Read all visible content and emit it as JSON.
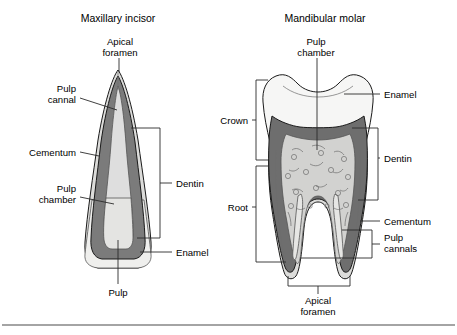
{
  "figure": {
    "background_color": "#ffffff",
    "bottom_rule_color": "#4a4a4a"
  },
  "palette": {
    "enamel": "#f2f2f0",
    "enamel_outer": "#e3e3e1",
    "cementum": "#dcdcda",
    "dentin": "#7b7b7b",
    "dentin_dark": "#6e6e6e",
    "pulp": "#d8d8d6",
    "pulp_light": "#e8e8e6",
    "outline": "#1a1a1a",
    "leader": "#2b2b2b",
    "text": "#000000"
  },
  "panels": [
    {
      "id": "maxillary-incisor",
      "title": "Maxillary incisor",
      "labels": [
        {
          "id": "apical-foramen",
          "lines": [
            "Apical",
            "foramen"
          ],
          "anchor": "middle",
          "x": 120,
          "y": 52
        },
        {
          "id": "pulp-cannal",
          "lines": [
            "Pulp",
            "cannal"
          ],
          "anchor": "end",
          "x": 76,
          "y": 97
        },
        {
          "id": "cementum",
          "lines": [
            "Cementum"
          ],
          "anchor": "end",
          "x": 76,
          "y": 155
        },
        {
          "id": "pulp-chamber",
          "lines": [
            "Pulp",
            "chamber"
          ],
          "anchor": "end",
          "x": 76,
          "y": 195
        },
        {
          "id": "dentin",
          "lines": [
            "Dentin"
          ],
          "anchor": "start",
          "x": 176,
          "y": 186
        },
        {
          "id": "enamel",
          "lines": [
            "Enamel"
          ],
          "anchor": "start",
          "x": 176,
          "y": 254
        },
        {
          "id": "pulp",
          "lines": [
            "Pulp"
          ],
          "anchor": "middle",
          "x": 118,
          "y": 294
        }
      ]
    },
    {
      "id": "mandibular-molar",
      "title": "Mandibular molar",
      "labels": [
        {
          "id": "pulp-chamber",
          "lines": [
            "Pulp",
            "chamber"
          ],
          "anchor": "middle",
          "x": 316,
          "y": 52
        },
        {
          "id": "enamel",
          "lines": [
            "Enamel"
          ],
          "anchor": "start",
          "x": 384,
          "y": 96
        },
        {
          "id": "crown",
          "lines": [
            "Crown"
          ],
          "anchor": "end",
          "x": 248,
          "y": 120
        },
        {
          "id": "dentin",
          "lines": [
            "Dentin"
          ],
          "anchor": "start",
          "x": 384,
          "y": 160
        },
        {
          "id": "root",
          "lines": [
            "Root"
          ],
          "anchor": "end",
          "x": 248,
          "y": 206
        },
        {
          "id": "cementum",
          "lines": [
            "Cementum"
          ],
          "anchor": "start",
          "x": 384,
          "y": 223
        },
        {
          "id": "pulp-cannals",
          "lines": [
            "Pulp",
            "cannals"
          ],
          "anchor": "start",
          "x": 384,
          "y": 241
        },
        {
          "id": "apical-foramen",
          "lines": [
            "Apical",
            "foramen"
          ],
          "anchor": "middle",
          "x": 318,
          "y": 300
        }
      ]
    }
  ]
}
